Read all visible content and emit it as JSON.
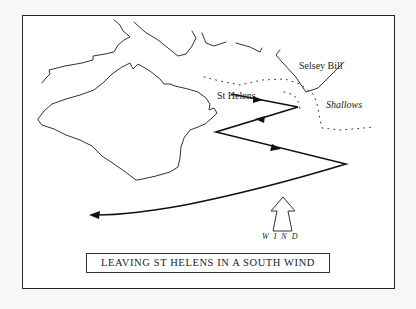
{
  "diagram": {
    "title": "Leaving St Helens in a South Wind",
    "caption": "LEAVING ST HELENS IN A SOUTH WIND",
    "labels": {
      "st_helens": "St Helens",
      "selsey_bill": "Selsey Bill",
      "shallows": "Shallows",
      "wind": "WIND"
    },
    "elements": [
      "island-coastline",
      "mainland-coastline",
      "shallows-dotted-line",
      "course-track-with-arrows",
      "wind-arrow"
    ],
    "colors": {
      "ink": "#222222",
      "paper": "#ffffff",
      "background": "#f7f7f6"
    }
  }
}
